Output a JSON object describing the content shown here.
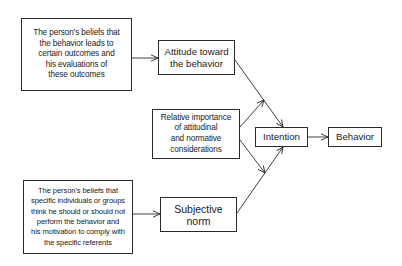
{
  "diagram": {
    "type": "flow",
    "title": "",
    "nodes": [
      {
        "id": "beliefs_outcomes",
        "label": "The person's beliefs that the behavior leads to certain outcomes and his evaluations of these outcomes"
      },
      {
        "id": "attitude",
        "label": "Attitude toward the behavior"
      },
      {
        "id": "relative_importance",
        "label": "Relative importance of attitudinal and normative considerations"
      },
      {
        "id": "intention",
        "label": "Intention"
      },
      {
        "id": "behavior",
        "label": "Behavior"
      },
      {
        "id": "normative_beliefs",
        "label": "The person's beliefs that specific individuals or groups think he should or should not perform the behavior and his motivation to comply with the specific referents"
      },
      {
        "id": "subjective_norm",
        "label": "Subjective norm"
      }
    ],
    "edges": [
      {
        "from": "beliefs_outcomes",
        "to": "attitude"
      },
      {
        "from": "attitude",
        "to": "intention"
      },
      {
        "from": "relative_importance",
        "to": "attitude_to_intention_link"
      },
      {
        "from": "relative_importance",
        "to": "subjective_norm_to_intention_link"
      },
      {
        "from": "normative_beliefs",
        "to": "subjective_norm"
      },
      {
        "from": "subjective_norm",
        "to": "intention"
      },
      {
        "from": "intention",
        "to": "behavior"
      }
    ]
  },
  "boxes": {
    "beliefs_outcomes": [
      "The person's beliefs that",
      "the behavior leads to",
      "certain outcomes and",
      "his evaluations of",
      "these outcomes"
    ],
    "attitude": [
      "Attitude toward",
      "the behavior"
    ],
    "relative_importance": [
      "Relative importance",
      "of attitudinal",
      "and normative",
      "considerations"
    ],
    "intention": "Intention",
    "behavior": "Behavior",
    "normative_beliefs": [
      "The person's beliefs that",
      "specific individuals or groups",
      "think he should or should not",
      "perform the behavior and",
      "his motivation to comply with",
      "the specific referents"
    ],
    "subjective_norm": "Subjective norm"
  },
  "colors": {
    "line": "#2a2a2a",
    "background": "#ffffff"
  }
}
